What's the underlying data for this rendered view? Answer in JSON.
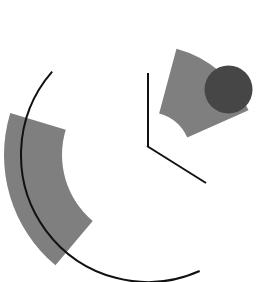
{
  "figure": {
    "background_color": "#ffffff",
    "width": 274,
    "height": 282,
    "center": {
      "x": 148,
      "y": 155
    }
  },
  "palette": {
    "gray_fill": "#7f7f7f",
    "dark_fill": "#464646",
    "stroke": "#111111",
    "background": "#ffffff"
  },
  "chart_data": {
    "type": "pie",
    "center": {
      "x": 148,
      "y": 155
    },
    "outer_radius": 127,
    "legend": "none",
    "grid": false,
    "elements": [
      {
        "name": "upper-wedge",
        "shape": "annular-sector",
        "fill": "#7f7f7f",
        "start_angle_deg": 163,
        "end_angle_deg": 230,
        "inner_radius": 86,
        "outer_radius": 144,
        "bbox": {
          "x": 71,
          "y": 14,
          "w": 81,
          "h": 58
        }
      },
      {
        "name": "lower-wedge",
        "shape": "annular-sector",
        "fill": "#7f7f7f",
        "start_angle_deg": 24,
        "end_angle_deg": 75,
        "inner_radius": 43,
        "outer_radius": 110,
        "bbox": {
          "x": 176,
          "y": 183,
          "w": 72,
          "h": 67
        }
      },
      {
        "name": "outer-arc",
        "shape": "arc",
        "stroke": "#111111",
        "stroke_width": 2,
        "radius": 127,
        "start_angle_deg": 139,
        "end_angle_deg": 294,
        "bbox": {
          "x": 21,
          "y": 63,
          "w": 143,
          "h": 208
        }
      },
      {
        "name": "vertical-radius-line",
        "shape": "line",
        "stroke": "#111111",
        "stroke_width": 2,
        "x1": 148,
        "y1": 73,
        "x2": 148,
        "y2": 147
      },
      {
        "name": "diagonal-radius-line",
        "shape": "line",
        "stroke": "#111111",
        "stroke_width": 2,
        "x1": 147,
        "y1": 146,
        "x2": 206,
        "y2": 183
      },
      {
        "name": "solid-dot",
        "shape": "circle",
        "fill": "#464646",
        "cx": 228.5,
        "cy": 89.5,
        "r": 24
      }
    ]
  }
}
